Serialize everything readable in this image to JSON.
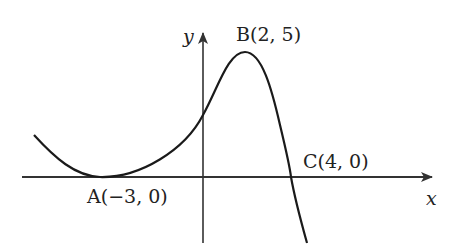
{
  "diagram": {
    "type": "function-graph",
    "axes": {
      "x_label": "x",
      "y_label": "y"
    },
    "points": [
      {
        "id": "A",
        "label": "A(−3, 0)",
        "x": -3,
        "y": 0,
        "description": "local minimum, tangent to x-axis"
      },
      {
        "id": "B",
        "label": "B(2, 5)",
        "x": 2,
        "y": 5,
        "description": "local maximum"
      },
      {
        "id": "C",
        "label": "C(4, 0)",
        "x": 4,
        "y": 0,
        "description": "x-intercept, curve crosses axis"
      }
    ],
    "colors": {
      "curve": "#1a1a1a",
      "axes": "#333333",
      "background": "#ffffff"
    }
  }
}
